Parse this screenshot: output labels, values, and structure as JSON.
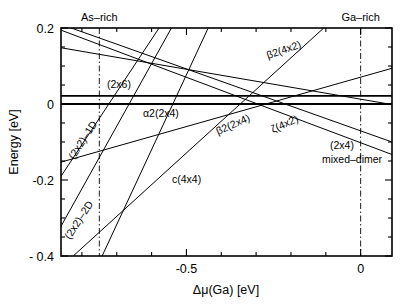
{
  "chart_data": {
    "type": "line",
    "title": "",
    "xlabel": "Δμ(Ga) [eV]",
    "ylabel": "Energy [eV]",
    "xlim": [
      -0.86,
      0.09
    ],
    "ylim": [
      -0.4,
      0.2
    ],
    "xticks": [
      -0.5,
      0.0
    ],
    "xticklabels": [
      "-0.5",
      "0"
    ],
    "yticks": [
      0.2,
      0.0,
      -0.2,
      -0.4
    ],
    "yticklabels": [
      "0.2",
      "0",
      "-0.2",
      "- 0.4"
    ],
    "xminor_step": 0.1,
    "yminor_step": 0.05,
    "grid": false,
    "legend": "inline-annotations",
    "vlines": [
      {
        "name": "As-rich",
        "x": -0.75,
        "style": "dash-dot",
        "label": "As–rich"
      },
      {
        "name": "Ga-rich",
        "x": 0.0,
        "style": "dash-dot",
        "label": "Ga–rich"
      }
    ],
    "series": [
      {
        "name": "(2x6)",
        "label": "(2x6)",
        "x": [
          -0.86,
          0.09
        ],
        "y": [
          0.0215,
          0.0215
        ],
        "width": 1.9
      },
      {
        "name": "zero-line",
        "label": "",
        "x": [
          -0.86,
          0.09
        ],
        "y": [
          0.0,
          0.0
        ],
        "width": 1.9
      },
      {
        "name": "alpha2(2x4)",
        "label": "α2(2x4)",
        "x": [
          -0.86,
          0.09
        ],
        "y": [
          0.148,
          -0.0015
        ],
        "width": 1.0
      },
      {
        "name": "beta2(2x4)",
        "label": "β2(2x4)",
        "x": [
          -0.86,
          0.09
        ],
        "y": [
          -0.153,
          0.094
        ],
        "width": 1.0
      },
      {
        "name": "beta2(4x2)",
        "label": "β2(4x2)",
        "x": [
          -0.825,
          -0.1
        ],
        "y": [
          -0.4,
          0.205
        ],
        "width": 1.0
      },
      {
        "name": "zeta(4x2)",
        "label": "ζ(4x2)",
        "x": [
          -0.855,
          0.09
        ],
        "y": [
          0.208,
          -0.1
        ],
        "width": 1.0
      },
      {
        "name": "(2x4)mixed-dimer",
        "label": "(2x4) mixed–dimer",
        "x": [
          -0.862,
          0.09
        ],
        "y": [
          0.195,
          -0.133
        ],
        "width": 1.0
      },
      {
        "name": "(2x2)-1D",
        "label": "(2x2)–1D",
        "x": [
          -0.862,
          -0.575
        ],
        "y": [
          -0.193,
          0.205
        ],
        "width": 1.0
      },
      {
        "name": "(2x2)-2D",
        "label": "(2x2)–2D",
        "x": [
          -0.862,
          -0.54
        ],
        "y": [
          -0.325,
          0.205
        ],
        "width": 1.0
      },
      {
        "name": "c(4x4)",
        "label": "c(4x4)",
        "x": [
          -0.742,
          -0.435
        ],
        "y": [
          -0.4,
          0.205
        ],
        "width": 1.0
      }
    ],
    "annotations": [
      {
        "text": "(2x6)",
        "x": 107,
        "y": 88,
        "rotate": 0,
        "anchor": "start"
      },
      {
        "text": "α2(2x4)",
        "x": 143,
        "y": 117,
        "rotate": 0,
        "anchor": "start"
      },
      {
        "text": "β2(4x2)",
        "x": 268,
        "y": 59,
        "rotate": -19,
        "anchor": "start"
      },
      {
        "text": "β2(2x4)",
        "x": 218,
        "y": 135,
        "rotate": -24,
        "anchor": "start"
      },
      {
        "text": "ζ(4x2)",
        "x": 273,
        "y": 133,
        "rotate": -24,
        "anchor": "start"
      },
      {
        "text": "(2x4)",
        "x": 330,
        "y": 149,
        "rotate": 0,
        "anchor": "start"
      },
      {
        "text": "mixed–dimer",
        "x": 322,
        "y": 163,
        "rotate": 0,
        "anchor": "start"
      },
      {
        "text": "(2x2)–1D",
        "x": 74,
        "y": 160,
        "rotate": -57,
        "anchor": "start"
      },
      {
        "text": "(2x2)–2D",
        "x": 70,
        "y": 240,
        "rotate": -57,
        "anchor": "start"
      },
      {
        "text": "c(4x4)",
        "x": 172,
        "y": 183,
        "rotate": 0,
        "anchor": "start"
      }
    ],
    "frame": {
      "left": 61,
      "right": 392,
      "top": 28,
      "bottom": 256
    }
  }
}
